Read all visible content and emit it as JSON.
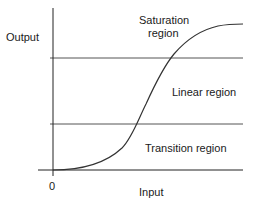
{
  "diagram": {
    "type": "transfer-characteristic",
    "axes": {
      "y_label": "Output",
      "x_label": "Input",
      "origin_label": "0"
    },
    "regions": [
      {
        "name": "saturation",
        "label_line1": "Saturation",
        "label_line2": "region"
      },
      {
        "name": "linear",
        "label": "Linear region"
      },
      {
        "name": "transition",
        "label": "Transition region"
      }
    ],
    "colors": {
      "line": "#222222",
      "grid": "#555555",
      "text": "#1a1a1a",
      "background": "#ffffff"
    }
  }
}
